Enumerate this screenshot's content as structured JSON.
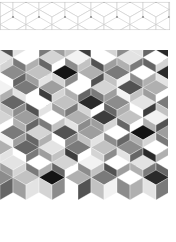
{
  "figure": {
    "background_color": "#ffffff",
    "width": 176,
    "height": 242
  },
  "panels": [
    {
      "id": "outline-band",
      "name": "rhombille-outline-band",
      "role": "wireframe strip of the rhombille (cube) tiling",
      "x": 0,
      "y": 2,
      "width": 170,
      "height": 28,
      "fill": "#ffffff",
      "stroke_color": "#c9c9c9",
      "stroke_width": 0.6,
      "vertex_dot_color": "#9a9a9a",
      "vertex_dot_radius": 0.9,
      "show_vertex_dots": true,
      "show_fills": false
    },
    {
      "id": "filled-block",
      "name": "rhombille-filled-block",
      "role": "grayscale-filled rhombille (cube) tiling",
      "x": 0,
      "y": 52,
      "width": 168,
      "height": 190,
      "fill": "#ffffff",
      "stroke_color": "#ffffff",
      "stroke_width": 0.35,
      "show_vertex_dots": false,
      "show_fills": true
    }
  ],
  "geometry": {
    "type": "rhombille",
    "hex_width": 26,
    "hex_height": 30,
    "row_pitch": 30,
    "col_pitch": 26,
    "rhombi_per_cell": 3,
    "faces": [
      "top",
      "left",
      "right"
    ],
    "description": "Each hexagonal cell is split into three 60/120 rhombi meeting at the center, giving an isometric cube appearance."
  },
  "palette": {
    "name": "grayscale",
    "swatches": [
      "#ffffff",
      "#f2f2f2",
      "#e3e3e3",
      "#d4d4d4",
      "#c2c2c2",
      "#b0b0b0",
      "#9e9e9e",
      "#8c8c8c",
      "#7a7a7a",
      "#666666",
      "#525252",
      "#3d3d3d",
      "#2a2a2a",
      "#141414"
    ],
    "white": "#ffffff",
    "black": "#141414",
    "accent": "#8c8c8c"
  },
  "chart_data": {
    "type": "heatmap",
    "xlabel": "",
    "ylabel": "",
    "grid": false,
    "legend": "none",
    "note": "Values are palette indices 0-13 for the three rhombi (top, left, right) of each hexagonal cell, ordered row-major.",
    "cols": 7,
    "rows": 7,
    "cells": [
      [
        [
          2,
          6,
          3
        ],
        [
          0,
          8,
          5
        ],
        [
          3,
          9,
          0
        ],
        [
          1,
          7,
          4
        ],
        [
          0,
          10,
          6
        ],
        [
          2,
          5,
          8
        ],
        [
          0,
          9,
          3
        ]
      ],
      [
        [
          7,
          0,
          9
        ],
        [
          4,
          6,
          2
        ],
        [
          13,
          3,
          7
        ],
        [
          5,
          0,
          10
        ],
        [
          8,
          4,
          1
        ],
        [
          0,
          7,
          5
        ],
        [
          12,
          2,
          8
        ]
      ],
      [
        [
          1,
          9,
          5
        ],
        [
          8,
          2,
          0
        ],
        [
          6,
          11,
          3
        ],
        [
          0,
          5,
          9
        ],
        [
          3,
          8,
          6
        ],
        [
          10,
          1,
          4
        ],
        [
          5,
          6,
          0
        ]
      ],
      [
        [
          9,
          4,
          7
        ],
        [
          0,
          10,
          2
        ],
        [
          4,
          6,
          8
        ],
        [
          12,
          3,
          0
        ],
        [
          7,
          9,
          5
        ],
        [
          2,
          0,
          11
        ],
        [
          8,
          4,
          6
        ]
      ],
      [
        [
          3,
          7,
          0
        ],
        [
          6,
          5,
          9
        ],
        [
          0,
          8,
          4
        ],
        [
          5,
          2,
          7
        ],
        [
          11,
          6,
          3
        ],
        [
          4,
          9,
          0
        ],
        [
          1,
          5,
          10
        ]
      ],
      [
        [
          8,
          1,
          6
        ],
        [
          3,
          9,
          5
        ],
        [
          10,
          0,
          7
        ],
        [
          6,
          4,
          2
        ],
        [
          0,
          7,
          9
        ],
        [
          13,
          5,
          3
        ],
        [
          6,
          8,
          1
        ]
      ],
      [
        [
          5,
          10,
          2
        ],
        [
          9,
          0,
          8
        ],
        [
          2,
          6,
          4
        ],
        [
          8,
          11,
          0
        ],
        [
          4,
          3,
          7
        ],
        [
          7,
          2,
          9
        ],
        [
          0,
          12,
          5
        ]
      ]
    ]
  }
}
